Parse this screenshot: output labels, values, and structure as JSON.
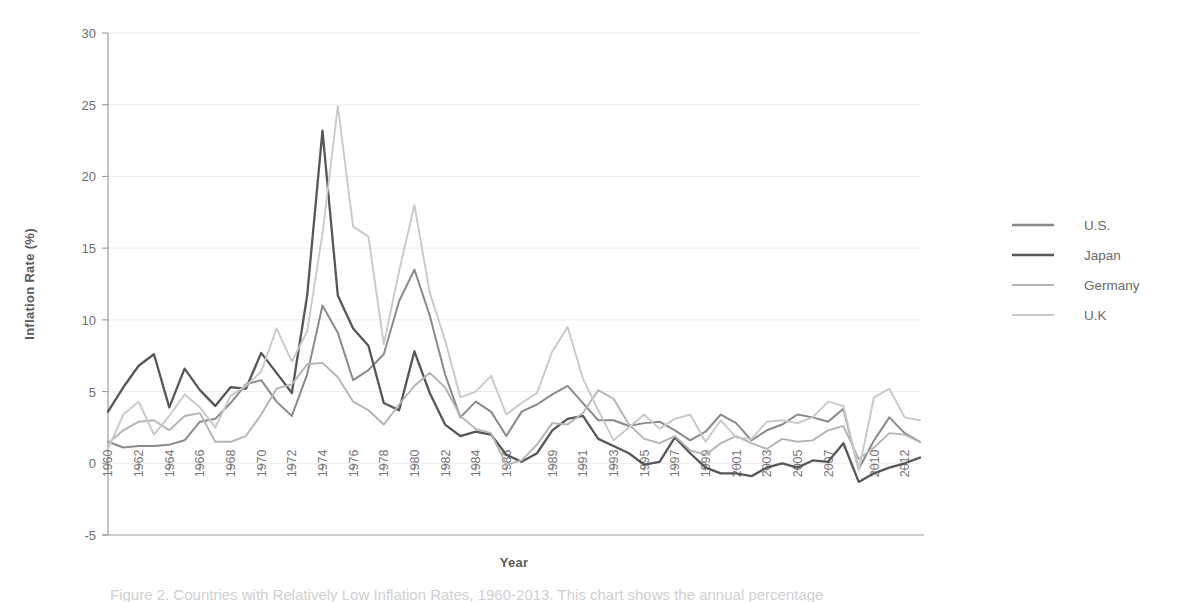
{
  "chart_data": {
    "type": "line",
    "title": "",
    "xlabel": "Year",
    "ylabel": "Inflation Rate (%)",
    "ylim": [
      -5,
      30
    ],
    "yticks": [
      -5,
      0,
      5,
      10,
      15,
      20,
      25,
      30
    ],
    "ytick_labels": [
      "-5",
      "0",
      "5",
      "10",
      "15",
      "20",
      "25",
      "30"
    ],
    "xlim": [
      1960,
      2013
    ],
    "grid": true,
    "legend_position": "right",
    "xtick_labels": [
      "1960",
      "1962",
      "1964",
      "1966",
      "1968",
      "1970",
      "1972",
      "1974",
      "1976",
      "1978",
      "1980",
      "1982",
      "1984",
      "1986",
      "1989",
      "1991",
      "1993",
      "1995",
      "1997",
      "1999",
      "2001",
      "2003",
      "2005",
      "2007",
      "2010",
      "2012"
    ],
    "xtick_values": [
      1960,
      1962,
      1964,
      1966,
      1968,
      1970,
      1972,
      1974,
      1976,
      1978,
      1980,
      1982,
      1984,
      1986,
      1989,
      1991,
      1993,
      1995,
      1997,
      1999,
      2001,
      2003,
      2005,
      2007,
      2010,
      2012
    ],
    "x": [
      1960,
      1961,
      1962,
      1963,
      1964,
      1965,
      1966,
      1967,
      1968,
      1969,
      1970,
      1971,
      1972,
      1973,
      1974,
      1975,
      1976,
      1977,
      1978,
      1979,
      1980,
      1981,
      1982,
      1983,
      1984,
      1985,
      1986,
      1987,
      1988,
      1989,
      1990,
      1991,
      1992,
      1993,
      1994,
      1995,
      1996,
      1997,
      1998,
      1999,
      2000,
      2001,
      2002,
      2003,
      2004,
      2005,
      2006,
      2007,
      2008,
      2009,
      2010,
      2011,
      2012,
      2013
    ],
    "series": [
      {
        "name": "U.S.",
        "color": "#8a8a8a",
        "width": 2.0,
        "values": [
          1.5,
          1.1,
          1.2,
          1.2,
          1.3,
          1.6,
          2.9,
          3.1,
          4.2,
          5.5,
          5.8,
          4.3,
          3.3,
          6.2,
          11.0,
          9.1,
          5.8,
          6.5,
          7.6,
          11.3,
          13.5,
          10.3,
          6.2,
          3.2,
          4.3,
          3.6,
          1.9,
          3.6,
          4.1,
          4.8,
          5.4,
          4.2,
          3.0,
          3.0,
          2.6,
          2.8,
          2.9,
          2.3,
          1.6,
          2.2,
          3.4,
          2.8,
          1.6,
          2.3,
          2.7,
          3.4,
          3.2,
          2.9,
          3.8,
          -0.4,
          1.6,
          3.2,
          2.1,
          1.5
        ]
      },
      {
        "name": "Japan",
        "color": "#575757",
        "width": 2.3,
        "values": [
          3.6,
          5.3,
          6.8,
          7.6,
          3.9,
          6.6,
          5.1,
          4.0,
          5.3,
          5.2,
          7.7,
          6.3,
          4.9,
          11.7,
          23.2,
          11.7,
          9.4,
          8.2,
          4.2,
          3.7,
          7.8,
          4.9,
          2.7,
          1.9,
          2.2,
          2.0,
          0.6,
          0.1,
          0.7,
          2.3,
          3.1,
          3.3,
          1.7,
          1.2,
          0.7,
          -0.1,
          0.1,
          1.8,
          0.7,
          -0.3,
          -0.7,
          -0.7,
          -0.9,
          -0.3,
          0.0,
          -0.3,
          0.2,
          0.1,
          1.4,
          -1.3,
          -0.7,
          -0.3,
          0.0,
          0.4
        ]
      },
      {
        "name": "Germany",
        "color": "#b4b4b4",
        "width": 1.9,
        "values": [
          1.4,
          2.3,
          2.9,
          3.0,
          2.3,
          3.3,
          3.5,
          1.5,
          1.5,
          1.9,
          3.4,
          5.2,
          5.5,
          6.9,
          7.0,
          6.0,
          4.3,
          3.7,
          2.7,
          4.1,
          5.4,
          6.3,
          5.3,
          3.3,
          2.4,
          2.1,
          -0.1,
          0.2,
          1.3,
          2.8,
          2.7,
          3.5,
          5.1,
          4.5,
          2.7,
          1.7,
          1.4,
          1.9,
          0.9,
          0.6,
          1.4,
          1.9,
          1.4,
          1.0,
          1.7,
          1.5,
          1.6,
          2.3,
          2.6,
          0.3,
          1.1,
          2.1,
          2.0,
          1.5
        ]
      },
      {
        "name": "U.K",
        "color": "#c9c9c9",
        "width": 1.9,
        "values": [
          1.0,
          3.4,
          4.3,
          2.0,
          3.3,
          4.8,
          3.9,
          2.5,
          4.7,
          5.4,
          6.4,
          9.4,
          7.1,
          9.2,
          16.0,
          24.9,
          16.5,
          15.8,
          8.3,
          13.4,
          18.0,
          11.9,
          8.6,
          4.6,
          5.0,
          6.1,
          3.4,
          4.2,
          4.9,
          7.8,
          9.5,
          5.9,
          3.7,
          1.6,
          2.5,
          3.4,
          2.4,
          3.1,
          3.4,
          1.5,
          3.0,
          1.8,
          1.7,
          2.9,
          3.0,
          2.8,
          3.2,
          4.3,
          4.0,
          -0.5,
          4.6,
          5.2,
          3.2,
          3.0
        ]
      }
    ]
  },
  "legend": {
    "items": [
      {
        "label": "U.S."
      },
      {
        "label": "Japan"
      },
      {
        "label": "Germany"
      },
      {
        "label": "U.K"
      }
    ]
  },
  "caption": {
    "text": "Figure 2. Countries with Relatively Low Inflation Rates, 1960-2013. This chart shows the annual percentage"
  }
}
